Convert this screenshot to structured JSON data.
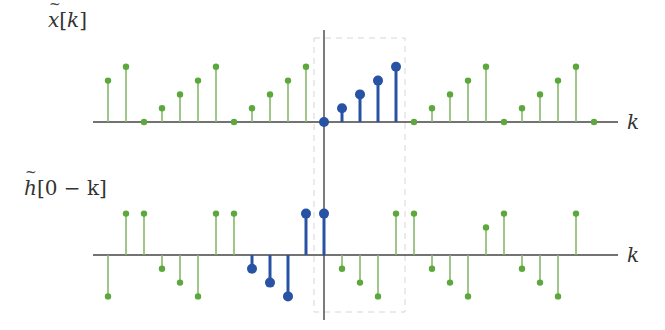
{
  "colors": {
    "green_dot": "#5ca83c",
    "green_stem": "#86b86a",
    "blue": "#2852a4",
    "axis": "#444444",
    "dashed_box": "#d6d6d6"
  },
  "labels": {
    "top_signal": {
      "base": "x",
      "arg": "[k]"
    },
    "bottom_signal": {
      "base": "h",
      "arg": "[0 − k]"
    },
    "top_axis": "k",
    "bottom_axis": "k"
  },
  "chart_data": [
    {
      "type": "stem",
      "title": "x̃[k]",
      "xlabel": "k",
      "description": "Periodic sequence with period 5 (values 0,1,2,3,4); one period k=0..4 highlighted in blue",
      "k": [
        -12,
        -11,
        -10,
        -9,
        -8,
        -7,
        -6,
        -5,
        -4,
        -3,
        -2,
        -1,
        0,
        1,
        2,
        3,
        4,
        5,
        6,
        7,
        8,
        9,
        10,
        11,
        12,
        13,
        14,
        15
      ],
      "values": [
        3,
        4,
        0,
        1,
        2,
        3,
        4,
        0,
        1,
        2,
        3,
        4,
        0,
        1,
        2,
        3,
        4,
        0,
        1,
        2,
        3,
        4,
        0,
        1,
        2,
        3,
        4,
        0
      ],
      "highlight": [
        0,
        1,
        2,
        3,
        4
      ],
      "ylim": [
        0,
        4
      ]
    },
    {
      "type": "stem",
      "title": "h̃[0 − k]",
      "xlabel": "k",
      "description": "Time-reversed periodic sequence; samples k=-4..0 highlighted in blue",
      "k": [
        -12,
        -11,
        -10,
        -9,
        -8,
        -7,
        -6,
        -5,
        -4,
        -3,
        -2,
        -1,
        0,
        1,
        2,
        3,
        4,
        5,
        6,
        7,
        8,
        9,
        10,
        11,
        12,
        13,
        14
      ],
      "values": [
        -3,
        3,
        3,
        -1,
        -2,
        -3,
        3,
        3,
        -1,
        -2,
        -3,
        3,
        3,
        -1,
        -2,
        -3,
        3,
        3,
        -1,
        -2,
        -3,
        2,
        3,
        -1,
        -2,
        -3,
        3,
        3
      ],
      "highlight": [
        -4,
        -3,
        -2,
        -1,
        0
      ],
      "ylim": [
        -3,
        3
      ]
    }
  ],
  "layout": {
    "origin_x": 324,
    "spacing": 18,
    "top_axis_y": 122,
    "bottom_axis_y": 255,
    "unit_px": 13.8,
    "axis_x_start": 93,
    "axis_x_end": 618,
    "vaxis_top": 30,
    "vaxis_bottom": 320,
    "box": {
      "x": 314,
      "y": 38,
      "w": 91,
      "h": 274
    }
  }
}
